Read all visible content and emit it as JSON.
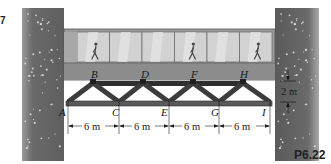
{
  "figure": {
    "problem_number": "P6.22",
    "corner_number_fragment": "7",
    "joint_labels": {
      "top": [
        "B",
        "D",
        "F",
        "H"
      ],
      "bottom": [
        "A",
        "C",
        "E",
        "G",
        "I"
      ]
    },
    "dimensions": {
      "panel_spacings": [
        "6 m",
        "6 m",
        "6 m",
        "6 m"
      ],
      "truss_height": "2 m"
    },
    "scene": {
      "walkway_windows": 6,
      "pedestrians": 3,
      "pedestrian_window_indices": [
        0,
        3,
        5
      ]
    },
    "colors": {
      "wall": "#6e6e6e",
      "walkway_frame": "#9a9a9a",
      "window_glass": "#d2d2d2",
      "deck": "#8c8c8c",
      "truss_member": "#3c3c3c",
      "text": "#1a1a1a"
    }
  }
}
